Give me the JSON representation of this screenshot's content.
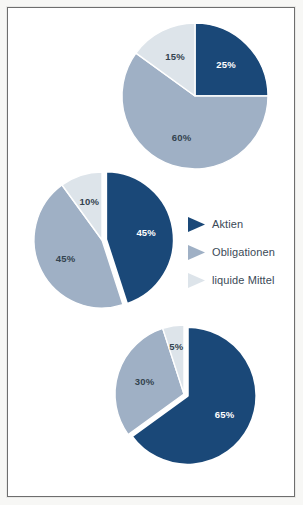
{
  "figure": {
    "background_color": "#f7f7f5",
    "panel_color": "#ffffff",
    "frame_color": "#6e6e6e"
  },
  "palette": {
    "aktien": "#1a4878",
    "obligationen": "#9fb0c5",
    "liquide_mittel": "#dde4ea",
    "slice_gap": "#ffffff",
    "label_on_dark": "#ffffff",
    "label_on_light": "#33434f",
    "legend_text": "#3b4a57"
  },
  "legend": {
    "position": "middle-right",
    "items": [
      {
        "label": "Aktien",
        "color": "#1a4878",
        "marker": "wedge-marker-icon"
      },
      {
        "label": "Obligationen",
        "color": "#9fb0c5",
        "marker": "wedge-marker-icon"
      },
      {
        "label": "liquide Mittel",
        "color": "#dde4ea",
        "marker": "wedge-marker-icon"
      }
    ]
  },
  "chart_data": [
    {
      "type": "pie",
      "name": "portfolio-conservative",
      "title": "",
      "categories": [
        "Aktien",
        "Obligationen",
        "liquide Mittel"
      ],
      "values": [
        25,
        60,
        15
      ],
      "labels": [
        "25%",
        "60%",
        "15%"
      ],
      "colors": [
        "#1a4878",
        "#9fb0c5",
        "#dde4ea"
      ],
      "label_colors": [
        "#ffffff",
        "#33434f",
        "#33434f"
      ],
      "center": [
        195,
        96
      ],
      "radius": 73,
      "start_angle_deg": 0,
      "direction": "clockwise",
      "exploded": []
    },
    {
      "type": "pie",
      "name": "portfolio-balanced",
      "title": "",
      "categories": [
        "Aktien",
        "Obligationen",
        "liquide Mittel"
      ],
      "values": [
        45,
        45,
        10
      ],
      "labels": [
        "45%",
        "45%",
        "10%"
      ],
      "colors": [
        "#1a4878",
        "#9fb0c5",
        "#dde4ea"
      ],
      "label_colors": [
        "#ffffff",
        "#33434f",
        "#33434f"
      ],
      "center": [
        102,
        240
      ],
      "radius": 68,
      "start_angle_deg": 0,
      "direction": "clockwise",
      "exploded": [
        "Aktien"
      ]
    },
    {
      "type": "pie",
      "name": "portfolio-growth",
      "title": "",
      "categories": [
        "Aktien",
        "Obligationen",
        "liquide Mittel"
      ],
      "values": [
        65,
        30,
        5
      ],
      "labels": [
        "65%",
        "30%",
        "5%"
      ],
      "colors": [
        "#1a4878",
        "#9fb0c5",
        "#dde4ea"
      ],
      "label_colors": [
        "#ffffff",
        "#33434f",
        "#33434f"
      ],
      "center": [
        184,
        394
      ],
      "radius": 69,
      "start_angle_deg": 0,
      "direction": "clockwise",
      "exploded": [
        "Aktien"
      ]
    }
  ]
}
